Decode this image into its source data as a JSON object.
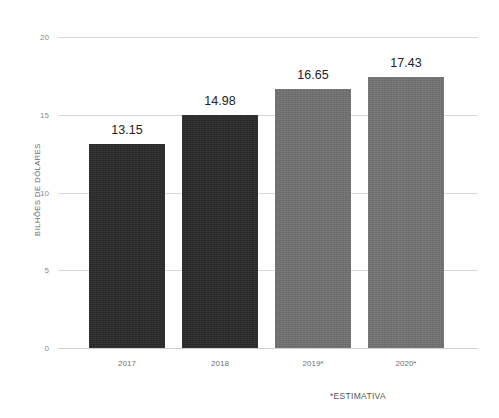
{
  "chart_data": {
    "type": "bar",
    "title": "",
    "xlabel": "",
    "ylabel": "BILHÕES DE DÓLARES",
    "categories": [
      "2017",
      "2018",
      "2019*",
      "2020*"
    ],
    "values": [
      13.15,
      14.98,
      16.65,
      17.43
    ],
    "value_labels": [
      "13.15",
      "14.98",
      "16.65",
      "17.43"
    ],
    "bar_colors": [
      "#2b2b2b",
      "#2b2b2b",
      "#727272",
      "#747474"
    ],
    "ylim": [
      0,
      20
    ],
    "yticks": [
      0,
      5,
      10,
      15,
      20
    ],
    "ytick_labels": [
      "0",
      "5",
      "10",
      "15",
      "20"
    ],
    "grid": true,
    "legend": false,
    "footnote": "*ESTIMATIVA",
    "gridline_color": "#d9d9d9",
    "axis_text_color": "#8a8a8a",
    "value_text_color": "#242424",
    "background": "#ffffff"
  }
}
